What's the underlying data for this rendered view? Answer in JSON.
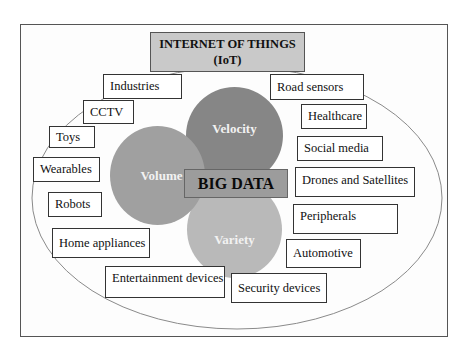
{
  "diagram": {
    "title": {
      "line1": "INTERNET OF THINGS",
      "line2": "(IoT)"
    },
    "center": {
      "label": "BIG DATA"
    },
    "vs": [
      {
        "label": "Velocity",
        "color": "#858585"
      },
      {
        "label": "Volume",
        "color": "#9e9e9e"
      },
      {
        "label": "Variety",
        "color": "#b9b9b9"
      }
    ],
    "devices_left": [
      {
        "label": "Industries"
      },
      {
        "label": "CCTV"
      },
      {
        "label": "Toys"
      },
      {
        "label": "Wearables"
      },
      {
        "label": "Robots"
      },
      {
        "label": "Home appliances"
      },
      {
        "label": "Entertainment devices"
      }
    ],
    "devices_right": [
      {
        "label": "Road sensors"
      },
      {
        "label": "Healthcare"
      },
      {
        "label": "Social media"
      },
      {
        "label": "Drones and Satellites"
      },
      {
        "label": "Peripherals"
      },
      {
        "label": "Automotive"
      },
      {
        "label": "Security devices"
      }
    ]
  }
}
